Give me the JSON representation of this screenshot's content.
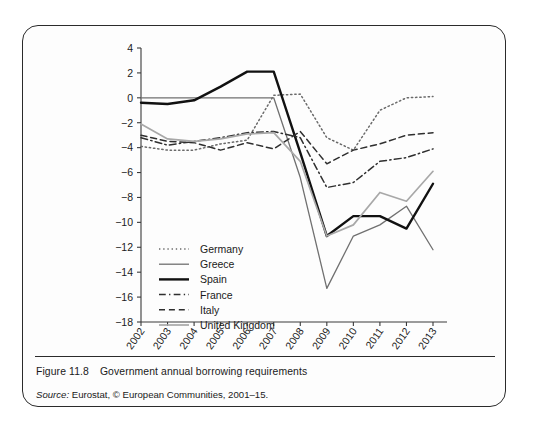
{
  "figure": {
    "number": "Figure 11.8",
    "title": "Government annual borrowing requirements",
    "source_label": "Source:",
    "source_text": " Eurostat, © European Communities, 2001–15."
  },
  "chart_data": {
    "type": "line",
    "title": "Government annual borrowing requirements",
    "xlabel": "",
    "ylabel": "",
    "grid": false,
    "legend_position": "inside-lower-left",
    "x": [
      "2002",
      "2003",
      "2004",
      "2005",
      "2006",
      "2007",
      "2008",
      "2009",
      "2010",
      "2011",
      "2012",
      "2013"
    ],
    "ylim": [
      -18,
      4
    ],
    "yticks": [
      4,
      2,
      0,
      -2,
      -4,
      -6,
      -8,
      -10,
      -12,
      -14,
      -16,
      -18
    ],
    "series": [
      {
        "name": "Germany",
        "style": "dotted",
        "color": "#6a6a6a",
        "width": 1.5,
        "values": [
          -3.9,
          -4.2,
          -4.2,
          -3.7,
          -3.4,
          0.2,
          0.3,
          -3.2,
          -4.2,
          -1.0,
          0.0,
          0.1
        ]
      },
      {
        "name": "Greece",
        "style": "solid",
        "color": "#707070",
        "width": 1.3,
        "values": [
          0.0,
          0.0,
          0.0,
          0.0,
          0.0,
          0.0,
          -6.4,
          -15.3,
          -11.1,
          -10.2,
          -8.7,
          -12.2
        ]
      },
      {
        "name": "Spain",
        "style": "solid",
        "color": "#111111",
        "width": 2.4,
        "values": [
          -0.4,
          -0.5,
          -0.2,
          0.9,
          2.1,
          2.1,
          -4.4,
          -11.1,
          -9.5,
          -9.5,
          -10.5,
          -6.9
        ]
      },
      {
        "name": "France",
        "style": "dashdot",
        "color": "#2f2f2f",
        "width": 1.5,
        "values": [
          -3.2,
          -3.8,
          -3.5,
          -3.2,
          -2.8,
          -2.7,
          -3.2,
          -7.2,
          -6.8,
          -5.1,
          -4.8,
          -4.1
        ]
      },
      {
        "name": "Italy",
        "style": "dashed",
        "color": "#2f2f2f",
        "width": 1.5,
        "values": [
          -3.0,
          -3.5,
          -3.6,
          -4.2,
          -3.6,
          -4.1,
          -2.7,
          -5.3,
          -4.2,
          -3.7,
          -3.0,
          -2.8
        ]
      },
      {
        "name": "United Kingdom",
        "style": "solid",
        "color": "#a8a8a8",
        "width": 1.7,
        "values": [
          -2.1,
          -3.3,
          -3.5,
          -3.3,
          -2.9,
          -2.8,
          -5.1,
          -11.1,
          -10.2,
          -7.6,
          -8.3,
          -5.9
        ]
      }
    ]
  }
}
